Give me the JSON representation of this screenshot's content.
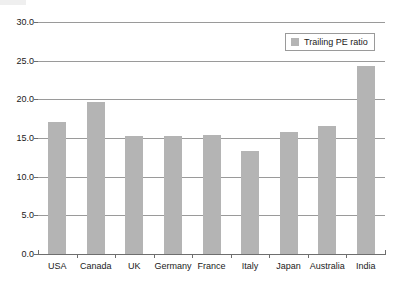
{
  "chart_data": {
    "type": "bar",
    "title": "",
    "subtitle": "",
    "xlabel": "",
    "ylabel": "",
    "categories": [
      "USA",
      "Canada",
      "UK",
      "Germany",
      "France",
      "Italy",
      "Japan",
      "Australia",
      "India"
    ],
    "series": [
      {
        "name": "Trailing PE ratio",
        "color": "#b4b4b4",
        "values": [
          17.1,
          19.6,
          15.3,
          15.2,
          15.4,
          13.3,
          15.8,
          16.5,
          24.3
        ]
      }
    ],
    "ylim": [
      0.0,
      30.0
    ],
    "ytick_values": [
      0.0,
      5.0,
      10.0,
      15.0,
      20.0,
      25.0,
      30.0
    ],
    "ytick_labels": [
      "0.0",
      "5.0",
      "10.0",
      "15.0",
      "20.0",
      "25.0",
      "30.0"
    ],
    "grid": true,
    "grid_axis": "y",
    "legend": {
      "position": "top-right",
      "entries": [
        {
          "label": "Trailing PE ratio",
          "color": "#b4b4b4"
        }
      ]
    },
    "colors": {
      "bar_fill": "#b4b4b4",
      "gridline": "#9a9a9a",
      "axis": "#6e6e6e",
      "text": "#1a1a1a",
      "background": "#ffffff"
    }
  }
}
